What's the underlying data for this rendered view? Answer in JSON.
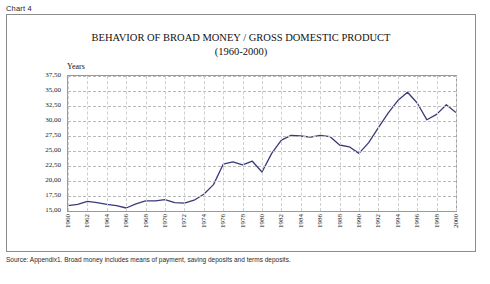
{
  "chart_label": "Chart 4",
  "title_line1": "BEHAVIOR OF BROAD MONEY / GROSS DOMESTIC PRODUCT",
  "title_line2": "(1960-2000)",
  "axis_caption": "Years",
  "source_note": "Source: Appendix1. Broad money includes means of payment, saving deposits and terms deposits.",
  "colors": {
    "line": "#3a3a7a",
    "frame": "#8c8c8c",
    "grid": "#b9b9b9",
    "text": "#1a1a1a",
    "background": "#ffffff"
  },
  "chart_data": {
    "type": "line",
    "title": "BEHAVIOR OF BROAD MONEY / GROSS DOMESTIC PRODUCT (1960-2000)",
    "xlabel": "Years",
    "ylabel": "",
    "ylim": [
      15.0,
      37.5
    ],
    "ytick_labels": [
      "37,50",
      "35,00",
      "32,50",
      "30,00",
      "27,50",
      "25,00",
      "22,50",
      "20,00",
      "17,50",
      "15,00"
    ],
    "ytick_values": [
      37.5,
      35.0,
      32.5,
      30.0,
      27.5,
      25.0,
      22.5,
      20.0,
      17.5,
      15.0
    ],
    "grid": true,
    "legend": "none",
    "xtick_labels": [
      "1960",
      "1962",
      "1964",
      "1966",
      "1968",
      "1970",
      "1972",
      "1974",
      "1976",
      "1978",
      "1980",
      "1982",
      "1984",
      "1986",
      "1988",
      "1990",
      "1992",
      "1994",
      "1996",
      "1998",
      "2000"
    ],
    "x": [
      1960,
      1961,
      1962,
      1963,
      1964,
      1965,
      1966,
      1967,
      1968,
      1969,
      1970,
      1971,
      1972,
      1973,
      1974,
      1975,
      1976,
      1977,
      1978,
      1979,
      1980,
      1981,
      1982,
      1983,
      1984,
      1985,
      1986,
      1987,
      1988,
      1989,
      1990,
      1991,
      1992,
      1993,
      1994,
      1995,
      1996,
      1997,
      1998,
      1999,
      2000
    ],
    "series": [
      {
        "name": "Broad money / GDP (%)",
        "values": [
          15.9,
          16.1,
          16.6,
          16.4,
          16.1,
          15.9,
          15.5,
          16.2,
          16.7,
          16.7,
          16.9,
          16.4,
          16.3,
          16.8,
          17.8,
          19.4,
          22.8,
          23.2,
          22.7,
          23.3,
          21.5,
          24.6,
          26.8,
          27.6,
          27.5,
          27.3,
          27.6,
          27.4,
          26.0,
          25.7,
          24.6,
          26.4,
          28.9,
          31.3,
          33.4,
          34.8,
          33.0,
          30.2,
          31.1,
          32.7,
          31.4
        ]
      }
    ]
  }
}
